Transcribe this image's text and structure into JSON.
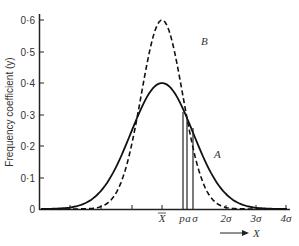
{
  "chart_data": {
    "type": "line",
    "title": "",
    "xlabel": "X",
    "ylabel": "Frequency coefficient (y)",
    "ylim": [
      0,
      0.6
    ],
    "yticks": [
      "0",
      "0·1",
      "0·2",
      "0·3",
      "0·4",
      "0·5",
      "0·6"
    ],
    "xtick_labels": [
      "X̄",
      "p",
      "a",
      "σ",
      "2σ",
      "3σ",
      "4σ"
    ],
    "grid": false,
    "series": [
      {
        "name": "A",
        "style": "solid",
        "description": "normal curve, σ = 1",
        "peak": 0.4
      },
      {
        "name": "B",
        "style": "dashed",
        "description": "narrower normal curve",
        "peak": 0.6
      }
    ],
    "annotations": [
      {
        "label": "p",
        "type": "vertical-line",
        "x_sigma": 0.68
      },
      {
        "label": "a",
        "type": "vertical-line",
        "x_sigma": 0.8
      },
      {
        "label": "σ",
        "type": "vertical-line",
        "x_sigma": 1.0
      }
    ],
    "arrow_label": "X"
  },
  "labels": {
    "y_axis": "Frequency coefficient (y)",
    "y_ticks": [
      "0",
      "0·1",
      "0·2",
      "0·3",
      "0·4",
      "0·5",
      "0·6"
    ],
    "x_mean": "X",
    "x_p": "p",
    "x_a": "a",
    "x_sigma": "σ",
    "x_2sigma": "2σ",
    "x_3sigma": "3σ",
    "x_4sigma": "4σ",
    "curve_a": "A",
    "curve_b": "B",
    "arrow_x": "X"
  }
}
